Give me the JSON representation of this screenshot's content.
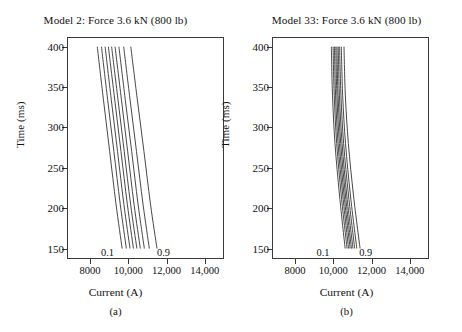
{
  "figure": {
    "background": "#ffffff",
    "line_color": "#333333",
    "axis_color": "#3a3a3a"
  },
  "panels": [
    {
      "key": "a",
      "title": "Model 2: Force 3.6 kN (800 lb)",
      "subcaption": "(a)",
      "xlabel": "Current (A)",
      "ylabel": "Time (ms)",
      "low_contour_label": "0.1",
      "high_contour_label": "0.9",
      "xticklabels": [
        "8000",
        "10,000",
        "12,000",
        "14,000"
      ],
      "yticklabels": [
        "150",
        "200",
        "250",
        "300",
        "350",
        "400"
      ]
    },
    {
      "key": "b",
      "title": "Model 33: Force 3.6 kN (800 lb)",
      "subcaption": "(b)",
      "xlabel": "Current (A)",
      "ylabel": "Time (ms)",
      "low_contour_label": "0.1",
      "high_contour_label": "0.9",
      "xticklabels": [
        "8000",
        "10,000",
        "12,000",
        "14,000"
      ],
      "yticklabels": [
        "150",
        "200",
        "250",
        "300",
        "350",
        "400"
      ]
    }
  ],
  "chart_data": [
    {
      "type": "line",
      "title": "Model 2: Force 3.6 kN (800 lb)",
      "subcaption": "(a)",
      "xlabel": "Current (A)",
      "ylabel": "Time (ms)",
      "xlim": [
        6800,
        15000
      ],
      "ylim": [
        137,
        412
      ],
      "xticks": [
        8000,
        10000,
        12000,
        14000
      ],
      "xticklabels": [
        "8000",
        "10,000",
        "12,000",
        "14,000"
      ],
      "yticks": [
        150,
        200,
        250,
        300,
        350,
        400
      ],
      "yticklabels": [
        "150",
        "200",
        "250",
        "300",
        "350",
        "400"
      ],
      "grid": false,
      "legend": "none",
      "annotations": [
        {
          "text": "0.1",
          "x": 9150,
          "y": 146
        },
        {
          "text": "0.9",
          "x": 11450,
          "y": 146
        }
      ],
      "series": [
        {
          "name": "0.1",
          "x": [
            8380,
            8700,
            9030,
            9360,
            9680
          ],
          "y": [
            400,
            335,
            270,
            205,
            150
          ]
        },
        {
          "name": "0.2",
          "x": [
            8600,
            8920,
            9250,
            9580,
            9900
          ],
          "y": [
            400,
            335,
            270,
            205,
            150
          ]
        },
        {
          "name": "0.3",
          "x": [
            8790,
            9110,
            9440,
            9770,
            10090
          ],
          "y": [
            400,
            335,
            270,
            205,
            150
          ]
        },
        {
          "name": "0.4",
          "x": [
            8960,
            9290,
            9620,
            9950,
            10270
          ],
          "y": [
            400,
            335,
            270,
            205,
            150
          ]
        },
        {
          "name": "0.5",
          "x": [
            9130,
            9460,
            9790,
            10120,
            10450
          ],
          "y": [
            400,
            335,
            270,
            205,
            150
          ]
        },
        {
          "name": "0.6",
          "x": [
            9310,
            9640,
            9970,
            10300,
            10630
          ],
          "y": [
            400,
            335,
            270,
            205,
            150
          ]
        },
        {
          "name": "0.7",
          "x": [
            9510,
            9840,
            10180,
            10510,
            10840
          ],
          "y": [
            400,
            335,
            270,
            205,
            150
          ]
        },
        {
          "name": "0.8",
          "x": [
            9760,
            10090,
            10430,
            10770,
            11100
          ],
          "y": [
            400,
            335,
            270,
            205,
            150
          ]
        },
        {
          "name": "0.9",
          "x": [
            10130,
            10470,
            10820,
            11160,
            11500
          ],
          "y": [
            400,
            335,
            270,
            205,
            150
          ]
        }
      ]
    },
    {
      "type": "line",
      "title": "Model 33: Force 3.6 kN (800 lb)",
      "subcaption": "(b)",
      "xlabel": "Current (A)",
      "ylabel": "Time (ms)",
      "xlim": [
        6800,
        15000
      ],
      "ylim": [
        137,
        412
      ],
      "xticks": [
        8000,
        10000,
        12000,
        14000
      ],
      "xticklabels": [
        "8000",
        "10,000",
        "12,000",
        "14,000"
      ],
      "yticks": [
        150,
        200,
        250,
        300,
        350,
        400
      ],
      "yticklabels": [
        "150",
        "200",
        "250",
        "300",
        "350",
        "400"
      ],
      "grid": false,
      "legend": "none",
      "annotations": [
        {
          "text": "0.1",
          "x": 9700,
          "y": 146
        },
        {
          "text": "0.9",
          "x": 11300,
          "y": 146
        }
      ],
      "series": [
        {
          "name": "0.1",
          "x": [
            9900,
            9960,
            10090,
            10330,
            10620
          ],
          "y": [
            400,
            340,
            280,
            215,
            150
          ]
        },
        {
          "name": "0.2",
          "x": [
            9990,
            10050,
            10180,
            10420,
            10720
          ],
          "y": [
            400,
            340,
            280,
            215,
            150
          ]
        },
        {
          "name": "0.3",
          "x": [
            10060,
            10120,
            10250,
            10500,
            10800
          ],
          "y": [
            400,
            340,
            280,
            215,
            150
          ]
        },
        {
          "name": "0.4",
          "x": [
            10130,
            10190,
            10320,
            10570,
            10880
          ],
          "y": [
            400,
            340,
            280,
            215,
            150
          ]
        },
        {
          "name": "0.5",
          "x": [
            10190,
            10250,
            10390,
            10640,
            10950
          ],
          "y": [
            400,
            340,
            280,
            215,
            150
          ]
        },
        {
          "name": "0.6",
          "x": [
            10260,
            10320,
            10460,
            10710,
            11030
          ],
          "y": [
            400,
            340,
            280,
            215,
            150
          ]
        },
        {
          "name": "0.7",
          "x": [
            10330,
            10400,
            10540,
            10800,
            11120
          ],
          "y": [
            400,
            340,
            280,
            215,
            150
          ]
        },
        {
          "name": "0.8",
          "x": [
            10420,
            10490,
            10640,
            10900,
            11230
          ],
          "y": [
            400,
            340,
            280,
            215,
            150
          ]
        },
        {
          "name": "0.9",
          "x": [
            10560,
            10630,
            10790,
            11060,
            11400
          ],
          "y": [
            400,
            340,
            280,
            215,
            150
          ]
        }
      ]
    }
  ]
}
